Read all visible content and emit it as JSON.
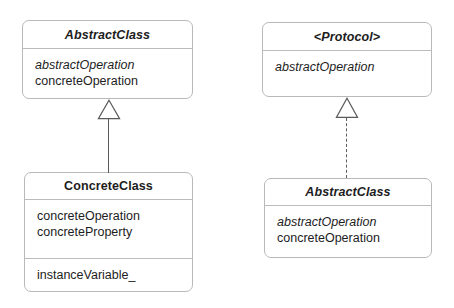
{
  "diagram": {
    "background_color": "#ffffff",
    "box_border_color": "#b9b9b9",
    "line_color": "#5a5a5a",
    "text_color": "#1d1d1d"
  },
  "classes": [
    {
      "id": "abstract-class-left",
      "name": "AbstractClass",
      "name_style": "bold-italic",
      "compartments": [
        {
          "members": [
            {
              "text": "abstractOperation",
              "style": "italic"
            },
            {
              "text": "concreteOperation",
              "style": "regular"
            }
          ]
        }
      ]
    },
    {
      "id": "concrete-class",
      "name": "ConcreteClass",
      "name_style": "bold",
      "compartments": [
        {
          "members": [
            {
              "text": "concreteOperation",
              "style": "regular"
            },
            {
              "text": "concreteProperty",
              "style": "regular"
            }
          ]
        },
        {
          "members": [
            {
              "text": "instanceVariable_",
              "style": "regular"
            }
          ]
        }
      ]
    },
    {
      "id": "protocol",
      "name": "<Protocol>",
      "name_style": "bold-italic",
      "compartments": [
        {
          "members": [
            {
              "text": "abstractOperation",
              "style": "italic"
            }
          ]
        }
      ]
    },
    {
      "id": "abstract-class-right",
      "name": "AbstractClass",
      "name_style": "bold-italic",
      "compartments": [
        {
          "members": [
            {
              "text": "abstractOperation",
              "style": "italic"
            },
            {
              "text": "concreteOperation",
              "style": "regular"
            }
          ]
        }
      ]
    }
  ],
  "relationships": [
    {
      "id": "inheritance",
      "kind": "generalization",
      "line_style": "solid",
      "arrow": "hollow-triangle",
      "from": "concrete-class",
      "to": "abstract-class-left"
    },
    {
      "id": "realization",
      "kind": "realization",
      "line_style": "dashed",
      "arrow": "hollow-triangle",
      "from": "abstract-class-right",
      "to": "protocol"
    }
  ]
}
